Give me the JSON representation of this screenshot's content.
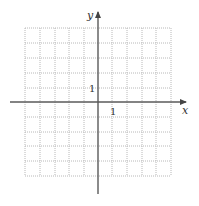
{
  "diagram": {
    "type": "coordinate-plane",
    "axes": {
      "x_label": "x",
      "y_label": "y",
      "x_tick_label": "1",
      "y_tick_label": "1"
    },
    "grid": {
      "x_min": -5,
      "x_max": 5,
      "y_min": -5,
      "y_max": 5,
      "spacing": 1,
      "style": "dotted"
    },
    "colors": {
      "axis": "#5a5a5a",
      "grid": "#b8b8b8",
      "background": "#ffffff"
    }
  }
}
